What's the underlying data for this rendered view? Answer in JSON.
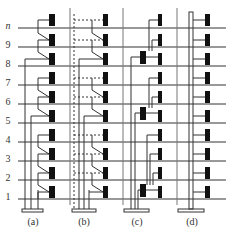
{
  "floors": [
    "n",
    "9",
    "8",
    "7",
    "6",
    "5",
    "4",
    "3",
    "2",
    "1"
  ],
  "panels": [
    {
      "id": "a",
      "caption": "(a)",
      "description": "series-connected units, solid risers"
    },
    {
      "id": "b",
      "caption": "(b)",
      "description": "series-connected units with dashed return lines"
    },
    {
      "id": "c",
      "caption": "(c)",
      "description": "grouped zones with intermediate units"
    },
    {
      "id": "d",
      "caption": "(d)",
      "description": "single central riser, direct branches"
    }
  ],
  "colors": {
    "line": "#333333",
    "block": "#111111",
    "background": "#ffffff"
  }
}
